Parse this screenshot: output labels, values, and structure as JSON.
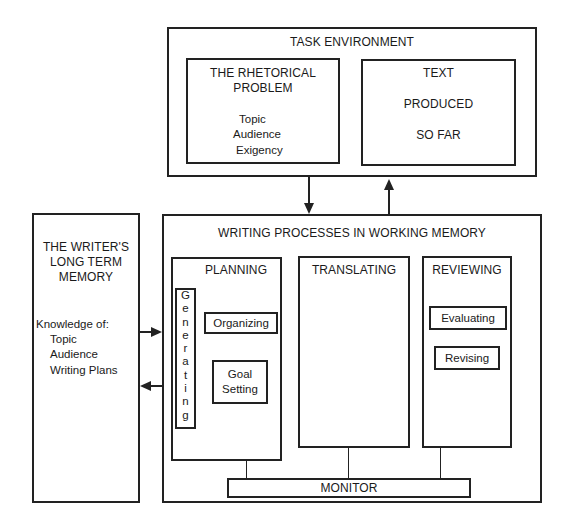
{
  "task_environment": {
    "title": "TASK ENVIRONMENT",
    "rhetorical_problem": {
      "title_line1": "THE RHETORICAL",
      "title_line2": "PROBLEM",
      "items": [
        "Topic",
        "Audience",
        "Exigency"
      ]
    },
    "text_produced": {
      "line1": "TEXT",
      "line2": "PRODUCED",
      "line3": "SO FAR"
    }
  },
  "long_term_memory": {
    "title_line1": "THE WRITER'S",
    "title_line2": "LONG TERM",
    "title_line3": "MEMORY",
    "knowledge_label": "Knowledge of:",
    "items": [
      "Topic",
      "Audience",
      "Writing Plans"
    ]
  },
  "working_memory": {
    "title": "WRITING PROCESSES IN WORKING MEMORY",
    "planning": {
      "title": "PLANNING",
      "generating": "Generating",
      "organizing": "Organizing",
      "goal_setting_line1": "Goal",
      "goal_setting_line2": "Setting"
    },
    "translating": {
      "title": "TRANSLATING"
    },
    "reviewing": {
      "title": "REVIEWING",
      "evaluating": "Evaluating",
      "revising": "Revising"
    },
    "monitor": "MONITOR"
  },
  "connections": [
    {
      "from": "task_environment",
      "to": "working_memory",
      "direction": "down"
    },
    {
      "from": "working_memory",
      "to": "task_environment",
      "direction": "up"
    },
    {
      "from": "long_term_memory",
      "to": "working_memory",
      "direction": "right"
    },
    {
      "from": "working_memory",
      "to": "long_term_memory",
      "direction": "left"
    },
    {
      "from": "planning",
      "to": "monitor"
    },
    {
      "from": "translating",
      "to": "monitor"
    },
    {
      "from": "reviewing",
      "to": "monitor"
    }
  ]
}
